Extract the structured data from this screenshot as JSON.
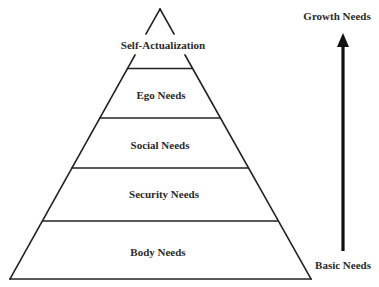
{
  "diagram": {
    "type": "pyramid",
    "line_color": "#222222",
    "levels": [
      {
        "label": "Self-Actualization",
        "order": 5
      },
      {
        "label": "Ego Needs",
        "order": 4
      },
      {
        "label": "Social Needs",
        "order": 3
      },
      {
        "label": "Security Needs",
        "order": 2
      },
      {
        "label": "Body Needs",
        "order": 1
      }
    ],
    "arrow": {
      "direction": "up",
      "top_label": "Growth Needs",
      "bottom_label": "Basic Needs"
    }
  }
}
